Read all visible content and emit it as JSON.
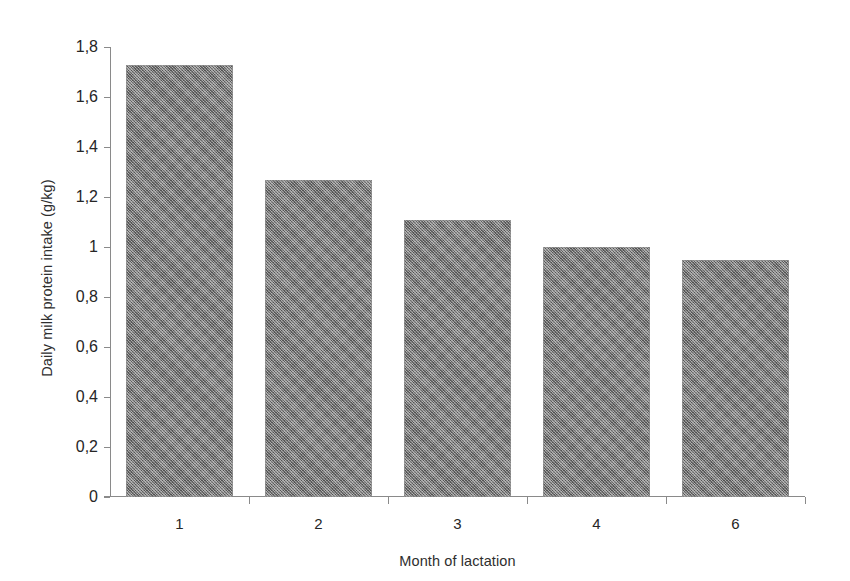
{
  "chart_data": {
    "type": "bar",
    "title": "",
    "subtitle": "",
    "xlabel": "Month of lactation",
    "ylabel": "Daily milk protein intake (g/kg)",
    "categories": [
      "1",
      "2",
      "3",
      "4",
      "6"
    ],
    "values": [
      1.73,
      1.27,
      1.11,
      1.0,
      0.95
    ],
    "ylim": [
      0,
      1.8
    ],
    "ytick_values": [
      0,
      0.2,
      0.4,
      0.6,
      0.8,
      1.0,
      1.2,
      1.4,
      1.6,
      1.8
    ],
    "ytick_labels": [
      "0",
      "0,2",
      "0,4",
      "0,6",
      "0,8",
      "1",
      "1,2",
      "1,4",
      "1,6",
      "1,8"
    ],
    "decimal_separator": ",",
    "grid": false,
    "legend": false,
    "legend_position": "none",
    "bar_color": "#7f7f7f",
    "axis_color": "#8a8a8a",
    "background_color": "#ffffff",
    "series": [
      {
        "name": "Daily milk protein intake",
        "values": [
          1.73,
          1.27,
          1.11,
          1.0,
          0.95
        ]
      }
    ]
  }
}
